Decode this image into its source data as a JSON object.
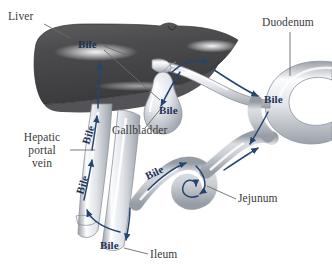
{
  "figure": {
    "background_color": "#ffffff",
    "label_color": "#3a3a3a",
    "bile_text_color": "#1c3157",
    "arrow_color": "#24456f",
    "organ_outline_color": "#8d929b",
    "liver_dark_color": "#4a4a4c",
    "liver_highlight_color": "#f2f2f4"
  },
  "organ_labels": [
    {
      "id": "liver",
      "text": "Liver",
      "x": 8,
      "y": 20,
      "anchor": "start"
    },
    {
      "id": "duodenum",
      "text": "Duodenum",
      "x": 262,
      "y": 26,
      "anchor": "start"
    },
    {
      "id": "gallbladder",
      "text": "Gallbladder",
      "x": 112,
      "y": 134,
      "anchor": "start"
    },
    {
      "id": "jejunum",
      "text": "Jejunum",
      "x": 238,
      "y": 202,
      "anchor": "start"
    },
    {
      "id": "ileum",
      "text": "Ileum",
      "x": 150,
      "y": 258,
      "anchor": "start"
    }
  ],
  "hepatic_portal_vein_label": {
    "id": "hepatic-portal-vein",
    "lines": [
      "Hepatic",
      "portal",
      "vein"
    ],
    "x": 42,
    "y": 141,
    "line_height": 13,
    "anchor": "middle"
  },
  "bile_labels": [
    {
      "id": "bile-liver",
      "text": "Bile",
      "x": 78,
      "y": 48,
      "rotate": 0,
      "anchor": "start"
    },
    {
      "id": "bile-gallbladder",
      "text": "Bile",
      "x": 159,
      "y": 114,
      "rotate": 0,
      "anchor": "start"
    },
    {
      "id": "bile-duodenum",
      "text": "Bile",
      "x": 264,
      "y": 103,
      "rotate": 0,
      "anchor": "start"
    },
    {
      "id": "bile-vein-upper",
      "text": "Bile",
      "x": 92,
      "y": 136,
      "rotate": -72,
      "anchor": "middle"
    },
    {
      "id": "bile-vein-lower",
      "text": "Bile",
      "x": 86,
      "y": 186,
      "rotate": -72,
      "anchor": "middle"
    },
    {
      "id": "bile-intestine",
      "text": "Bile",
      "x": 156,
      "y": 176,
      "rotate": -26,
      "anchor": "middle"
    },
    {
      "id": "bile-ileum",
      "text": "Bile",
      "x": 100,
      "y": 249,
      "rotate": 0,
      "anchor": "start"
    }
  ],
  "leader_lines": [
    {
      "id": "leader-liver",
      "d": "M 44 24 L 70 38"
    },
    {
      "id": "leader-duodenum",
      "d": "M 290 32 L 290 76"
    },
    {
      "id": "leader-gallbladder",
      "d": "M 145 128 L 163 106"
    },
    {
      "id": "leader-jejunum",
      "d": "M 236 199 L 207 186"
    },
    {
      "id": "leader-ileum",
      "d": "M 148 254 L 124 248"
    },
    {
      "id": "leader-portal-vein",
      "d": "M 70 150 L 95 150"
    },
    {
      "id": "leader-bile-liver-a",
      "d": "M 104 46 L 129 56"
    },
    {
      "id": "leader-bile-liver-b",
      "d": "M 104 50 L 160 100"
    }
  ],
  "flow_arrows": [
    {
      "id": "flow-liver-up",
      "d": "M 98 108 C 98 92 100 76 100 62"
    },
    {
      "id": "flow-gallbladder-in",
      "d": "M 180 72 C 172 84 166 96 161 106"
    },
    {
      "id": "flow-cystic-duct-up",
      "d": "M 172 72 C 183 62 196 58 208 62"
    },
    {
      "id": "flow-common-duct",
      "d": "M 214 70 C 230 80 244 90 258 96"
    },
    {
      "id": "flow-duodenum-down",
      "d": "M 268 112 C 262 124 256 134 250 144"
    },
    {
      "id": "flow-vein-up-1",
      "d": "M 84 200 C 87 186 90 172 92 160"
    },
    {
      "id": "flow-vein-up-2",
      "d": "M 92 150 C 94 138 96 126 97 116"
    },
    {
      "id": "flow-vein-bottom-u",
      "d": "M 120 232 C 104 228 92 222 87 210"
    },
    {
      "id": "flow-ileum-down",
      "d": "M 130 208 C 130 220 128 230 126 240"
    },
    {
      "id": "flow-intestine-a",
      "d": "M 148 190 C 160 178 172 168 186 163"
    },
    {
      "id": "flow-intestine-b",
      "d": "M 196 166 C 206 176 208 188 200 194"
    },
    {
      "id": "flow-intestine-coil",
      "d": "M 198 196 C 186 200 180 192 184 184 C 188 178 196 180 196 186"
    },
    {
      "id": "flow-intestine-c",
      "d": "M 224 170 C 236 162 248 154 258 148"
    }
  ]
}
